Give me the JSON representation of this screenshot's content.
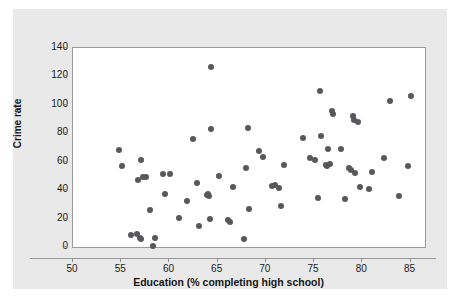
{
  "figure": {
    "background_color": "#ffffff",
    "panel_color": "#e9e9e9",
    "plot_background_color": "#ffffff",
    "frame_color": "#9a9a9a",
    "marker_color": "#58585c"
  },
  "chart_data": {
    "type": "scatter",
    "title": "",
    "xlabel": "Education (% completing high school)",
    "ylabel": "Crime rate",
    "xlim": [
      50,
      86.5
    ],
    "ylim": [
      0,
      140
    ],
    "xticks": [
      50,
      55,
      60,
      65,
      70,
      75,
      80,
      85
    ],
    "yticks": [
      0,
      20,
      40,
      60,
      80,
      100,
      120,
      140
    ],
    "xtick_labels": [
      "50",
      "55",
      "60",
      "65",
      "70",
      "75",
      "80",
      "85"
    ],
    "ytick_labels": [
      "0",
      "20",
      "40",
      "60",
      "80",
      "100",
      "120",
      "140"
    ],
    "grid": false,
    "legend": null,
    "legend_position": "none",
    "marker": "circle",
    "series": [
      {
        "name": "States",
        "points": [
          [
            54.8,
            68.0
          ],
          [
            55.1,
            57.2
          ],
          [
            56.0,
            8.6
          ],
          [
            56.6,
            9.0
          ],
          [
            56.7,
            47.0
          ],
          [
            56.9,
            6.6
          ],
          [
            57.0,
            61.5
          ],
          [
            57.1,
            5.4
          ],
          [
            57.3,
            48.9
          ],
          [
            57.6,
            49.1
          ],
          [
            58.0,
            25.8
          ],
          [
            58.3,
            0.4
          ],
          [
            58.5,
            6.2
          ],
          [
            59.3,
            51.3
          ],
          [
            59.5,
            37.3
          ],
          [
            60.1,
            51.6
          ],
          [
            61.0,
            20.7
          ],
          [
            61.8,
            32.1
          ],
          [
            62.4,
            76.0
          ],
          [
            62.9,
            44.7
          ],
          [
            63.1,
            15.1
          ],
          [
            63.9,
            36.8
          ],
          [
            64.0,
            37.1
          ],
          [
            64.1,
            36.2
          ],
          [
            64.2,
            19.6
          ],
          [
            64.3,
            82.8
          ],
          [
            64.3,
            126.6
          ],
          [
            65.1,
            50.0
          ],
          [
            66.1,
            19.3
          ],
          [
            66.3,
            17.6
          ],
          [
            66.6,
            42.1
          ],
          [
            67.7,
            5.9
          ],
          [
            67.9,
            55.4
          ],
          [
            68.1,
            84.0
          ],
          [
            68.2,
            26.6
          ],
          [
            69.3,
            67.8
          ],
          [
            69.7,
            63.3
          ],
          [
            70.6,
            42.8
          ],
          [
            70.9,
            43.4
          ],
          [
            71.4,
            41.8
          ],
          [
            71.6,
            28.8
          ],
          [
            71.9,
            57.4
          ],
          [
            73.9,
            77.0
          ],
          [
            74.6,
            62.8
          ],
          [
            75.1,
            60.9
          ],
          [
            75.4,
            34.7
          ],
          [
            75.6,
            109.9
          ],
          [
            75.7,
            78.2
          ],
          [
            76.2,
            57.9
          ],
          [
            76.3,
            56.8
          ],
          [
            76.4,
            68.8
          ],
          [
            76.6,
            58.4
          ],
          [
            76.9,
            95.7
          ],
          [
            77.0,
            93.5
          ],
          [
            77.8,
            68.6
          ],
          [
            78.2,
            33.9
          ],
          [
            78.6,
            55.8
          ],
          [
            78.8,
            54.4
          ],
          [
            79.0,
            92.4
          ],
          [
            79.1,
            89.3
          ],
          [
            79.2,
            52.4
          ],
          [
            79.6,
            88.2
          ],
          [
            79.8,
            42.0
          ],
          [
            80.7,
            40.8
          ],
          [
            81.0,
            53.0
          ],
          [
            82.2,
            62.5
          ],
          [
            82.9,
            103.0
          ],
          [
            83.8,
            36.2
          ],
          [
            84.7,
            57.1
          ],
          [
            85.0,
            106.0
          ]
        ]
      }
    ]
  }
}
